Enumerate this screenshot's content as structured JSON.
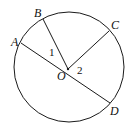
{
  "diagram": {
    "type": "circle-geometry",
    "circle": {
      "cx": 69,
      "cy": 67,
      "r": 55,
      "stroke": "#1a1a1a"
    },
    "center": {
      "label": "O",
      "x": 68,
      "y": 69
    },
    "points": [
      {
        "label": "A",
        "x": 21,
        "y": 43
      },
      {
        "label": "B",
        "x": 43,
        "y": 19
      },
      {
        "label": "C",
        "x": 109,
        "y": 31
      },
      {
        "label": "D",
        "x": 110,
        "y": 103
      }
    ],
    "segments": [
      {
        "from": "A",
        "to": "D"
      },
      {
        "from": "O",
        "to": "B"
      },
      {
        "from": "O",
        "to": "C"
      }
    ],
    "angle_labels": [
      {
        "label": "1",
        "x": 49,
        "y": 56
      },
      {
        "label": "2",
        "x": 77,
        "y": 74
      }
    ],
    "point_labels": {
      "A": {
        "x": 11,
        "y": 46
      },
      "B": {
        "x": 34,
        "y": 17
      },
      "C": {
        "x": 111,
        "y": 29
      },
      "D": {
        "x": 110,
        "y": 115
      },
      "O": {
        "x": 57,
        "y": 80
      }
    }
  }
}
